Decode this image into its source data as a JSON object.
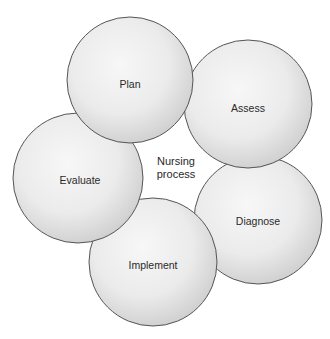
{
  "diagram": {
    "center_label": {
      "line1": "Nursing",
      "line2": "process"
    },
    "steps": [
      {
        "label": "Assess"
      },
      {
        "label": "Diagnose"
      },
      {
        "label": "Plan"
      },
      {
        "label": "Implement"
      },
      {
        "label": "Evaluate"
      }
    ],
    "colors": {
      "circle_fill_light": "#f4f4f4",
      "circle_fill_dark": "#d0d0d0",
      "circle_stroke": "#555555",
      "text": "#2a2a2a"
    }
  }
}
